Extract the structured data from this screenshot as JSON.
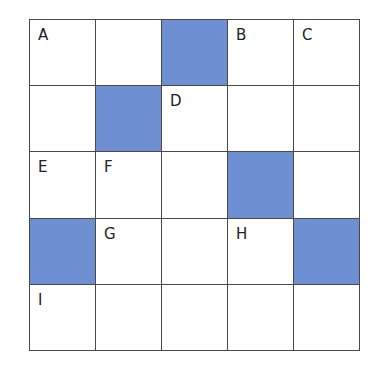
{
  "grid": {
    "rows": 5,
    "cols": 5,
    "shade_color": "#6f8fd3",
    "cells": [
      [
        {
          "label": "A",
          "shaded": false
        },
        {
          "label": "",
          "shaded": false
        },
        {
          "label": "",
          "shaded": true
        },
        {
          "label": "B",
          "shaded": false
        },
        {
          "label": "C",
          "shaded": false
        }
      ],
      [
        {
          "label": "",
          "shaded": false
        },
        {
          "label": "",
          "shaded": true
        },
        {
          "label": "D",
          "shaded": false
        },
        {
          "label": "",
          "shaded": false
        },
        {
          "label": "",
          "shaded": false
        }
      ],
      [
        {
          "label": "E",
          "shaded": false
        },
        {
          "label": "F",
          "shaded": false
        },
        {
          "label": "",
          "shaded": false
        },
        {
          "label": "",
          "shaded": true
        },
        {
          "label": "",
          "shaded": false
        }
      ],
      [
        {
          "label": "",
          "shaded": true
        },
        {
          "label": "G",
          "shaded": false
        },
        {
          "label": "",
          "shaded": false
        },
        {
          "label": "H",
          "shaded": false
        },
        {
          "label": "",
          "shaded": true
        }
      ],
      [
        {
          "label": "I",
          "shaded": false
        },
        {
          "label": "",
          "shaded": false
        },
        {
          "label": "",
          "shaded": false
        },
        {
          "label": "",
          "shaded": false
        },
        {
          "label": "",
          "shaded": false
        }
      ]
    ]
  }
}
